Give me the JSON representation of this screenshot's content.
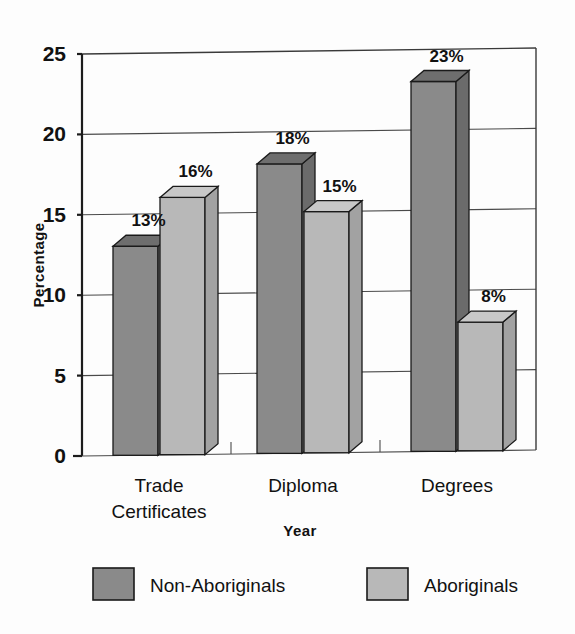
{
  "chart_data": {
    "type": "bar",
    "title": "",
    "subtitle": "",
    "xlabel": "Year",
    "ylabel": "Percentage",
    "categories": [
      "Trade Certificates",
      "Diploma",
      "Degrees"
    ],
    "category_lines": [
      [
        "Trade",
        "Certificates"
      ],
      [
        "Diploma"
      ],
      [
        "Degrees"
      ]
    ],
    "series": [
      {
        "name": "Non-Aboriginals",
        "values": [
          13,
          18,
          23
        ],
        "labels": [
          "13%",
          "18%",
          "23%"
        ],
        "color": "#8a8a8a"
      },
      {
        "name": "Aboriginals",
        "values": [
          16,
          15,
          8
        ],
        "labels": [
          "16%",
          "15%",
          "8%"
        ],
        "color": "#b8b8b8"
      }
    ],
    "ylim": [
      0,
      25
    ],
    "yticks": [
      0,
      5,
      10,
      15,
      20,
      25
    ],
    "ytick_labels": [
      "0",
      "5",
      "10",
      "15",
      "20",
      "25"
    ],
    "grid": true,
    "grid_axis": "y",
    "legend_position": "bottom",
    "style": "3d-grouped-bar",
    "colors": {
      "non_aboriginals_front": "#8a8a8a",
      "non_aboriginals_top": "#6e6e6e",
      "non_aboriginals_side": "#6b6b6b",
      "aboriginals_front": "#b8b8b8",
      "aboriginals_top": "#c8c8c8",
      "aboriginals_side": "#a2a2a2",
      "axis": "#1c1c1c",
      "grid": "#4a4a4a",
      "text": "#111111",
      "background": "#fdfdfd"
    }
  },
  "axes": {
    "y_title": "Percentage",
    "x_title": "Year"
  },
  "legend": {
    "items": [
      {
        "label": "Non-Aboriginals",
        "color": "#8a8a8a"
      },
      {
        "label": "Aboriginals",
        "color": "#b8b8b8"
      }
    ]
  }
}
